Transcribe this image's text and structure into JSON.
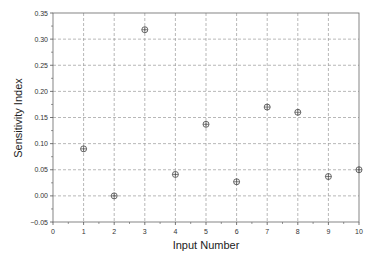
{
  "chart_data": {
    "type": "scatter",
    "title": "",
    "xlabel": "Input Number",
    "ylabel": "Sensitivity Index",
    "xlim": [
      0,
      10
    ],
    "ylim": [
      -0.05,
      0.35
    ],
    "xticks": [
      0,
      1,
      2,
      3,
      4,
      5,
      6,
      7,
      8,
      9,
      10
    ],
    "xtick_labels": [
      "0",
      "1",
      "2",
      "3",
      "4",
      "5",
      "6",
      "7",
      "8",
      "9",
      "10"
    ],
    "yticks": [
      -0.05,
      0.0,
      0.05,
      0.1,
      0.15,
      0.2,
      0.25,
      0.3,
      0.35
    ],
    "ytick_labels": [
      "−0.05",
      "0.00",
      "0.05",
      "0.10",
      "0.15",
      "0.20",
      "0.25",
      "0.30",
      "0.35"
    ],
    "grid": true,
    "marker": "circle-plus",
    "x": [
      1,
      2,
      3,
      4,
      5,
      6,
      7,
      8,
      9,
      10
    ],
    "values": [
      0.09,
      0.0,
      0.318,
      0.041,
      0.137,
      0.027,
      0.17,
      0.16,
      0.037,
      0.05
    ],
    "colors": {
      "axis": "#555555",
      "grid": "#999999",
      "marker": "#444444"
    }
  }
}
